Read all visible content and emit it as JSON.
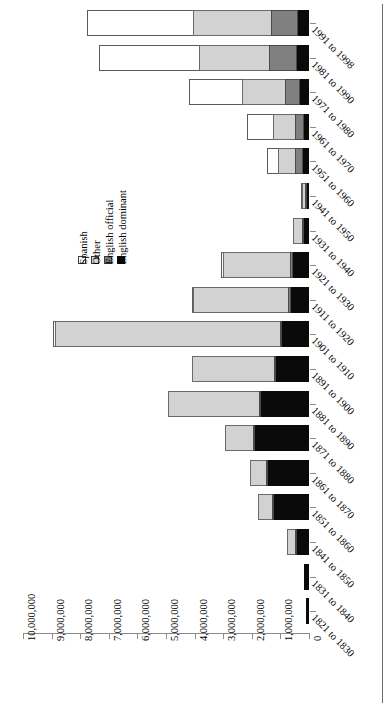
{
  "chart_data": {
    "type": "bar",
    "orientation": "horizontal",
    "stacked": true,
    "title": "",
    "xlabel": "",
    "ylabel": "",
    "xlim": [
      0,
      10000000
    ],
    "grid": false,
    "legend_position": "inside-left",
    "tick_labels": [
      "10,000,000",
      "9,000,000",
      "8,000,000",
      "7,000,000",
      "6,000,000",
      "5,000,000",
      "4,000,000",
      "3,000,000",
      "2,000,000",
      "1,000,000",
      "0"
    ],
    "tick_values": [
      10000000,
      9000000,
      8000000,
      7000000,
      6000000,
      5000000,
      4000000,
      3000000,
      2000000,
      1000000,
      0
    ],
    "categories": [
      "1991 to 1998",
      "1981 to 1990",
      "1971 to 1980",
      "1961 to 1970",
      "1951 to 1960",
      "1941 to 1950",
      "1931 to 1940",
      "1921 to 1930",
      "1911 to 1920",
      "1901 to 1910",
      "1891 to 1900",
      "1881 to 1890",
      "1871 to 1880",
      "1861 to 1870",
      "1851 to 1860",
      "1841 to 1850",
      "1831 to 1840",
      "1821 to 1830"
    ],
    "series": [
      {
        "name": "English dominant",
        "color": "#0a0a0a",
        "values": [
          390000,
          420000,
          320000,
          180000,
          220000,
          60000,
          160000,
          560000,
          620000,
          950000,
          1150000,
          1680000,
          1880000,
          1430000,
          1230000,
          430000,
          180000,
          120000
        ]
      },
      {
        "name": "English official",
        "color": "#808080",
        "values": [
          940000,
          990000,
          520000,
          310000,
          280000,
          30000,
          60000,
          120000,
          100000,
          80000,
          60000,
          40000,
          30000,
          20000,
          10000,
          5000,
          0,
          0
        ]
      },
      {
        "name": "Other",
        "color": "#d2d2d2",
        "values": [
          2760000,
          2480000,
          1540000,
          800000,
          630000,
          130000,
          370000,
          2360000,
          3380000,
          7900000,
          2920000,
          3200000,
          1020000,
          610000,
          510000,
          320000,
          0,
          0
        ]
      },
      {
        "name": "Spanish",
        "color": "#ffffff",
        "values": [
          3740000,
          3530000,
          1890000,
          960000,
          420000,
          50000,
          0,
          100000,
          60000,
          90000,
          0,
          0,
          0,
          0,
          0,
          0,
          0,
          0
        ]
      }
    ],
    "legend_entries": [
      "Spanish",
      "Other",
      "English official",
      "English dominant"
    ]
  }
}
